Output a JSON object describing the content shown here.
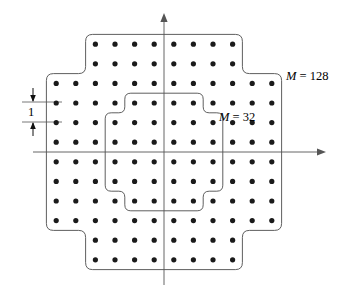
{
  "figure": {
    "type": "constellation-diagram",
    "background": "#ffffff",
    "stroke_color": "#4d4d4d",
    "axis_color": "#555555",
    "point_color": "#1a1a1a",
    "point_radius": 2.6,
    "grid_spacing_px": 19.6,
    "origin": {
      "x": 164.0,
      "y": 152.0
    }
  },
  "labels": {
    "outer_symbol": "M",
    "outer_equals": "=",
    "outer_value": "128",
    "inner_symbol": "M",
    "inner_equals": "=",
    "inner_value": "32",
    "spacing_value": "1"
  },
  "axes": {
    "horizontal": {
      "x1": 33,
      "y1": 152,
      "x2": 326,
      "y2": 152,
      "arrow": "right"
    },
    "vertical": {
      "x1": 164,
      "y1": 285,
      "x2": 164,
      "y2": 13,
      "arrow": "up"
    }
  },
  "dimension": {
    "label": "1",
    "tick_lines": [
      {
        "x1": 22,
        "y1": 102,
        "x2": 62,
        "y2": 102
      },
      {
        "x1": 22,
        "y1": 122,
        "x2": 62,
        "y2": 122
      }
    ],
    "upper_arrow": {
      "x": 33,
      "y_from": 88,
      "y_to": 102,
      "direction": "down"
    },
    "lower_arrow": {
      "x": 33,
      "y_from": 136,
      "y_to": 122,
      "direction": "up"
    }
  },
  "chart_data": {
    "type": "scatter",
    "xlabel": "",
    "ylabel": "",
    "grid": false,
    "legend": null,
    "unit_spacing": 1,
    "outer_boundary_label": "M = 128",
    "inner_boundary_label": "M = 32",
    "outer_columns_per_row": [
      8,
      8,
      12,
      12,
      12,
      12,
      12,
      12,
      12,
      12,
      8,
      8
    ],
    "inner_columns_per_row": [
      4,
      6,
      6,
      6,
      6,
      4
    ],
    "row_y_units": [
      5.5,
      4.5,
      3.5,
      2.5,
      1.5,
      0.5,
      -0.5,
      -1.5,
      -2.5,
      -3.5,
      -4.5,
      -5.5
    ],
    "outer_row_x_units": [
      [
        -3.5,
        -2.5,
        -1.5,
        -0.5,
        0.5,
        1.5,
        2.5,
        3.5
      ],
      [
        -3.5,
        -2.5,
        -1.5,
        -0.5,
        0.5,
        1.5,
        2.5,
        3.5
      ],
      [
        -5.5,
        -4.5,
        -3.5,
        -2.5,
        -1.5,
        -0.5,
        0.5,
        1.5,
        2.5,
        3.5,
        4.5,
        5.5
      ],
      [
        -5.5,
        -4.5,
        -3.5,
        -2.5,
        -1.5,
        -0.5,
        0.5,
        1.5,
        2.5,
        3.5,
        4.5,
        5.5
      ],
      [
        -5.5,
        -4.5,
        -3.5,
        -2.5,
        -1.5,
        -0.5,
        0.5,
        1.5,
        2.5,
        3.5,
        4.5,
        5.5
      ],
      [
        -5.5,
        -4.5,
        -3.5,
        -2.5,
        -1.5,
        -0.5,
        0.5,
        1.5,
        2.5,
        3.5,
        4.5,
        5.5
      ],
      [
        -5.5,
        -4.5,
        -3.5,
        -2.5,
        -1.5,
        -0.5,
        0.5,
        1.5,
        2.5,
        3.5,
        4.5,
        5.5
      ],
      [
        -5.5,
        -4.5,
        -3.5,
        -2.5,
        -1.5,
        -0.5,
        0.5,
        1.5,
        2.5,
        3.5,
        4.5,
        5.5
      ],
      [
        -5.5,
        -4.5,
        -3.5,
        -2.5,
        -1.5,
        -0.5,
        0.5,
        1.5,
        2.5,
        3.5,
        4.5,
        5.5
      ],
      [
        -5.5,
        -4.5,
        -3.5,
        -2.5,
        -1.5,
        -0.5,
        0.5,
        1.5,
        2.5,
        3.5,
        4.5,
        5.5
      ],
      [
        -3.5,
        -2.5,
        -1.5,
        -0.5,
        0.5,
        1.5,
        2.5,
        3.5
      ],
      [
        -3.5,
        -2.5,
        -1.5,
        -0.5,
        0.5,
        1.5,
        2.5,
        3.5
      ]
    ],
    "total_points_outer": 128,
    "total_points_inner": 32
  }
}
